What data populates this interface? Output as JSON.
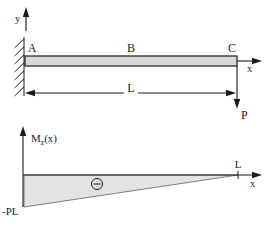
{
  "beam_diagram": {
    "y_axis_label": "y",
    "x_axis_label": "x",
    "support_label": "A",
    "midspan_label": "B",
    "tip_label": "C",
    "length_label": "L",
    "load_label": "P"
  },
  "moment_diagram": {
    "axis_label_main": "M",
    "axis_label_sub": "z",
    "axis_label_arg": "(x)",
    "x_axis_label": "x",
    "length_tick_label": "L",
    "min_value_label": "-PL",
    "sign_symbol": "−",
    "values": [
      {
        "x": "0",
        "M": "-PL"
      },
      {
        "x": "L",
        "M": "0"
      }
    ]
  },
  "colors": {
    "beam_fill": "#d9d9d9",
    "moment_fill": "#e3e3e3",
    "line": "#1a1a1a",
    "moment_outline": "#6f6f6f"
  }
}
